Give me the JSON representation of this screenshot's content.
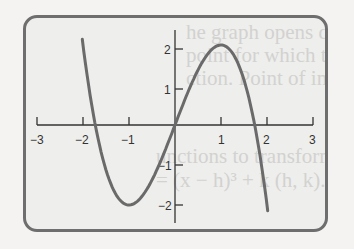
{
  "chart_data": {
    "type": "line",
    "title": "",
    "function": "y = 3x - x^3",
    "xlabel": "",
    "ylabel": "",
    "xlim": [
      -3,
      3
    ],
    "ylim": [
      -2.5,
      2.5
    ],
    "x_ticks": [
      "-3",
      "-2",
      "-1",
      "1",
      "2",
      "3"
    ],
    "y_ticks": [
      "2",
      "1",
      "-1",
      "-2"
    ],
    "grid": false,
    "legend": "none",
    "series": [
      {
        "name": "curve",
        "color": "#6a6a6a",
        "x": [
          -2.1,
          -2,
          -1.5,
          -1,
          -0.5,
          0,
          0.5,
          1,
          1.5,
          2,
          2.1
        ],
        "y": [
          2.96,
          2,
          -1.125,
          -2,
          -1.375,
          0,
          1.375,
          2,
          1.125,
          -2,
          -2.96
        ]
      }
    ],
    "key_points": {
      "local_max": [
        1,
        2
      ],
      "local_min": [
        -1,
        -2
      ],
      "origin": [
        0,
        0
      ]
    }
  },
  "background_text": {
    "line1": "he graph opens downward",
    "line2": "point for which the shaping",
    "line3": "ction. Point of inflection",
    "line4": "unctions to transform their",
    "line5": "= (x − h)³ + k    (h, k)."
  },
  "axis": {
    "x_labels": [
      "−3",
      "−2",
      "−1",
      "1",
      "2",
      "3"
    ],
    "y_labels": [
      "2",
      "1",
      "−1",
      "−2"
    ]
  }
}
